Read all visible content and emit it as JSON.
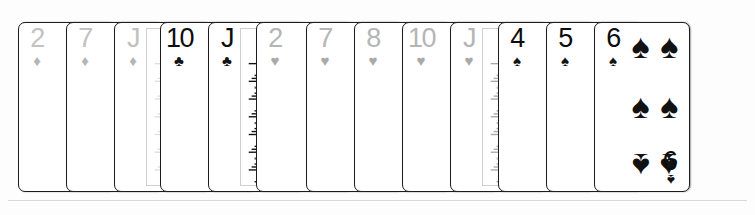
{
  "scene": {
    "title": "Fanned hand of playing cards",
    "card_count": 13,
    "background_color": "#fdfdfd",
    "card_face_color": "#ffffff",
    "card_border_color": "#1c1c1c"
  },
  "suit_glyphs": {
    "diamond": "♦",
    "heart": "♥",
    "club": "♣",
    "spade": "♠"
  },
  "suit_colors": {
    "diamond": "#b6b6b6",
    "heart": "#a9a9a9",
    "club": "#121212",
    "spade": "#121212"
  },
  "cards": [
    {
      "rank": "2",
      "suit": "diamond",
      "suit_name": "Diamonds",
      "label": "2 of Diamonds",
      "court": false,
      "visible_pips": 1,
      "left": 18,
      "z": 1
    },
    {
      "rank": "7",
      "suit": "diamond",
      "suit_name": "Diamonds",
      "label": "7 of Diamonds",
      "court": false,
      "visible_pips": 3,
      "left": 66,
      "z": 2
    },
    {
      "rank": "J",
      "suit": "diamond",
      "suit_name": "Diamonds",
      "label": "Jack of Diamonds",
      "court": true,
      "art": "light",
      "left": 114,
      "z": 3
    },
    {
      "rank": "10",
      "suit": "club",
      "suit_name": "Clubs",
      "label": "10 of Clubs",
      "court": false,
      "visible_pips": 4,
      "left": 160,
      "z": 4
    },
    {
      "rank": "J",
      "suit": "club",
      "suit_name": "Clubs",
      "label": "Jack of Clubs",
      "court": true,
      "art": "dark",
      "left": 208,
      "z": 5
    },
    {
      "rank": "2",
      "suit": "heart",
      "suit_name": "Hearts",
      "label": "2 of Hearts",
      "court": false,
      "visible_pips": 1,
      "left": 256,
      "z": 6
    },
    {
      "rank": "7",
      "suit": "heart",
      "suit_name": "Hearts",
      "label": "7 of Hearts",
      "court": false,
      "visible_pips": 3,
      "left": 306,
      "z": 7
    },
    {
      "rank": "8",
      "suit": "heart",
      "suit_name": "Hearts",
      "label": "8 of Hearts",
      "court": false,
      "visible_pips": 3,
      "left": 354,
      "z": 8
    },
    {
      "rank": "10",
      "suit": "heart",
      "suit_name": "Hearts",
      "label": "10 of Hearts",
      "court": false,
      "visible_pips": 4,
      "left": 402,
      "z": 9
    },
    {
      "rank": "J",
      "suit": "heart",
      "suit_name": "Hearts",
      "label": "Jack of Hearts",
      "court": true,
      "art": "medium",
      "left": 450,
      "z": 10
    },
    {
      "rank": "4",
      "suit": "spade",
      "suit_name": "Spades",
      "label": "4 of Spades",
      "court": false,
      "visible_pips": 2,
      "left": 498,
      "z": 11
    },
    {
      "rank": "5",
      "suit": "spade",
      "suit_name": "Spades",
      "label": "5 of Spades",
      "court": false,
      "visible_pips": 2,
      "left": 546,
      "z": 12
    },
    {
      "rank": "6",
      "suit": "spade",
      "suit_name": "Spades",
      "label": "6 of Spades",
      "court": false,
      "visible_pips": 6,
      "left": 594,
      "z": 13,
      "full": true,
      "corner_rank": "9"
    }
  ]
}
